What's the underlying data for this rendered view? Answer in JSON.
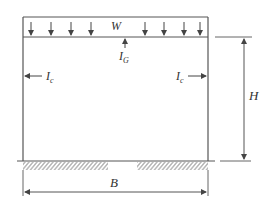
{
  "diagram": {
    "colors": {
      "line": "#555555",
      "hatch": "#666666",
      "text": "#333333",
      "background": "#ffffff"
    },
    "labels": {
      "load": "W",
      "beam_inertia": "I",
      "beam_inertia_sub": "G",
      "column_left": "I",
      "column_left_sub": "c",
      "column_right": "I",
      "column_right_sub": "c",
      "height": "H",
      "width": "B"
    },
    "load_arrow_count": 8
  }
}
